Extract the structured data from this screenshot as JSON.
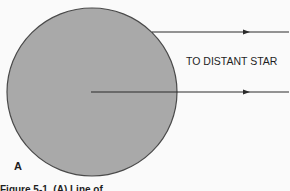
{
  "figure": {
    "body_label": "A",
    "ray_label": "TO DISTANT STAR",
    "caption": "Figure 5-1. (A) Line of",
    "colors": {
      "body_fill": "#a9a9a9",
      "body_stroke": "#4a4a4a",
      "line": "#2a2a2a",
      "background": "#fafafa"
    },
    "rays": [
      {
        "name": "upper-ray",
        "direction": "right",
        "origin": "body-tangent-top"
      },
      {
        "name": "lower-ray",
        "direction": "right",
        "origin": "body-center"
      }
    ]
  }
}
